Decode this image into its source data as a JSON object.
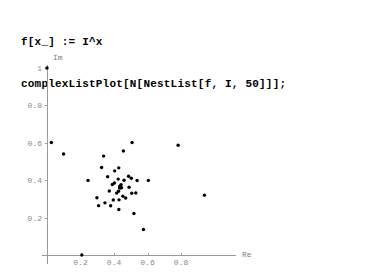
{
  "code": {
    "lines": [
      "f[x_] := I^x",
      "complexListPlot[N[NestList[f, I, 50]]];"
    ],
    "line1": "f[x_] := I^x",
    "line2": "complexListPlot[N[NestList[f, I, 50]]];"
  },
  "chart_data": {
    "type": "scatter",
    "title": "",
    "xlabel": "Re",
    "ylabel": "Im",
    "xlim": [
      -0.04,
      1.02
    ],
    "ylim": [
      -0.04,
      1.05
    ],
    "grid": false,
    "legend": "none",
    "marker_color": "#000000",
    "axis_color": "#9a9a9a",
    "label_color": "#8a8a8a",
    "xticks": [
      0.2,
      0.4,
      0.6,
      0.8
    ],
    "xtick_labels": [
      "0.2",
      "0.4",
      "0.6",
      "0.8"
    ],
    "yticks": [
      0.2,
      0.4,
      0.6,
      0.8,
      1
    ],
    "ytick_labels": [
      "0.2",
      "0.4",
      "0.6",
      "0.8",
      "1"
    ],
    "series": [
      {
        "name": "NestList[f, I, 50]",
        "x": [
          0.0,
          0.2079,
          0.4288,
          0.5033,
          0.4283,
          0.4026,
          0.4268,
          0.4451,
          0.4423,
          0.4346,
          0.4334,
          0.4369,
          0.4394,
          0.439,
          0.4378,
          0.4375,
          0.438,
          0.4384,
          0.4383,
          0.4381,
          0.4381,
          0.4382,
          0.4382,
          0.4382,
          0.4382,
          0.4382,
          0.4382,
          0.4382,
          0.4382,
          0.4382,
          0.4382,
          0.4382,
          0.4382,
          0.4382,
          0.4382,
          0.4382,
          0.4382,
          0.4382,
          0.4382,
          0.4382,
          0.4382,
          0.4382,
          0.4382,
          0.4382,
          0.4382,
          0.4382,
          0.4382,
          0.4382,
          0.4382,
          0.4382,
          0.4382
        ],
        "y": [
          1.0,
          0.0,
          0.243,
          0.4107,
          0.4661,
          0.3851,
          0.3411,
          0.3595,
          0.3764,
          0.3683,
          0.3589,
          0.3595,
          0.3629,
          0.3643,
          0.3626,
          0.3612,
          0.3612,
          0.3617,
          0.3619,
          0.3616,
          0.3614,
          0.3614,
          0.3615,
          0.3615,
          0.3615,
          0.3615,
          0.3615,
          0.3615,
          0.3615,
          0.3615,
          0.3615,
          0.3615,
          0.3615,
          0.3615,
          0.3615,
          0.3615,
          0.3615,
          0.3615,
          0.3615,
          0.3615,
          0.3615,
          0.3615,
          0.3615,
          0.3615,
          0.3615,
          0.3615,
          0.3615,
          0.3615,
          0.3615,
          0.3615,
          0.3615
        ]
      },
      {
        "name": "outliers",
        "x": [
          0.026,
          0.099,
          0.338,
          0.508,
          0.783,
          0.94,
          0.298,
          0.308,
          0.38,
          0.519,
          0.576,
          0.506,
          0.605,
          0.245,
          0.326,
          0.456,
          0.538,
          0.362,
          0.404,
          0.487,
          0.53,
          0.346,
          0.396,
          0.43,
          0.47,
          0.372,
          0.416,
          0.453,
          0.49,
          0.39,
          0.425,
          0.46
        ],
        "y": [
          0.602,
          0.54,
          0.529,
          0.602,
          0.587,
          0.32,
          0.306,
          0.264,
          0.263,
          0.222,
          0.136,
          0.33,
          0.399,
          0.399,
          0.468,
          0.556,
          0.398,
          0.419,
          0.45,
          0.421,
          0.332,
          0.279,
          0.294,
          0.295,
          0.305,
          0.342,
          0.331,
          0.314,
          0.362,
          0.377,
          0.406,
          0.4
        ]
      }
    ]
  }
}
